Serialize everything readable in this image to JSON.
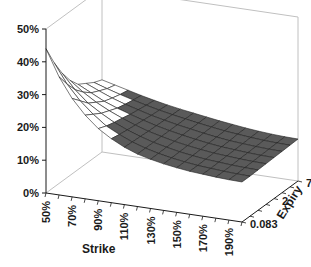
{
  "chart_data": {
    "type": "surface",
    "title": "",
    "xlabel": "Strike",
    "ylabel": "",
    "zlabel": "",
    "depth_label": "Expiry",
    "zlim": [
      0,
      50
    ],
    "z_ticks": [
      "0%",
      "10%",
      "20%",
      "30%",
      "40%",
      "50%"
    ],
    "x_ticks": [
      "50%",
      "70%",
      "90%",
      "110%",
      "130%",
      "150%",
      "170%",
      "190%"
    ],
    "depth_ticks": [
      "0.083",
      "2",
      "7"
    ],
    "grid": false,
    "strikes": [
      50,
      60,
      70,
      80,
      90,
      100,
      110,
      120,
      130,
      140,
      150,
      160,
      170,
      180,
      190,
      200
    ],
    "expiries": [
      0.083,
      0.25,
      0.5,
      1,
      2,
      3,
      5,
      7
    ],
    "series": [
      {
        "name": "0.083",
        "values": [
          44,
          36,
          30,
          25.5,
          22,
          19.5,
          17.5,
          16,
          15,
          14.2,
          13.6,
          13.1,
          12.8,
          12.5,
          12.3,
          12.2
        ]
      },
      {
        "name": "0.25",
        "values": [
          38,
          32,
          27.5,
          24,
          21,
          19,
          17.3,
          16,
          15,
          14.2,
          13.6,
          13.1,
          12.8,
          12.5,
          12.3,
          12.2
        ]
      },
      {
        "name": "0.5",
        "values": [
          33,
          28.5,
          25,
          22.5,
          20.3,
          18.6,
          17.2,
          16,
          15.1,
          14.3,
          13.7,
          13.2,
          12.9,
          12.6,
          12.4,
          12.3
        ]
      },
      {
        "name": "1",
        "values": [
          29,
          26,
          23.5,
          21.5,
          19.8,
          18.3,
          17,
          16,
          15.1,
          14.4,
          13.8,
          13.3,
          13,
          12.7,
          12.5,
          12.4
        ]
      },
      {
        "name": "2",
        "values": [
          26,
          24,
          22,
          20.5,
          19.2,
          18,
          16.9,
          16,
          15.2,
          14.5,
          13.9,
          13.4,
          13.1,
          12.8,
          12.6,
          12.5
        ]
      },
      {
        "name": "3",
        "values": [
          24.5,
          22.8,
          21.2,
          19.9,
          18.8,
          17.7,
          16.8,
          16,
          15.3,
          14.6,
          14,
          13.5,
          13.2,
          12.9,
          12.7,
          12.6
        ]
      },
      {
        "name": "5",
        "values": [
          23,
          21.7,
          20.5,
          19.4,
          18.4,
          17.5,
          16.7,
          16,
          15.3,
          14.7,
          14.1,
          13.7,
          13.3,
          13,
          12.8,
          12.7
        ]
      },
      {
        "name": "7",
        "values": [
          22,
          21,
          20,
          19,
          18.1,
          17.3,
          16.6,
          16,
          15.4,
          14.8,
          14.3,
          13.8,
          13.4,
          13.1,
          12.9,
          12.8
        ]
      }
    ],
    "colors": {
      "surface_low": "#5a5a5a",
      "surface_high": "#ffffff",
      "mesh": "#222222",
      "frame": "#c0c0c0",
      "axis": "#1a1a1a"
    },
    "shade_threshold": 20
  }
}
